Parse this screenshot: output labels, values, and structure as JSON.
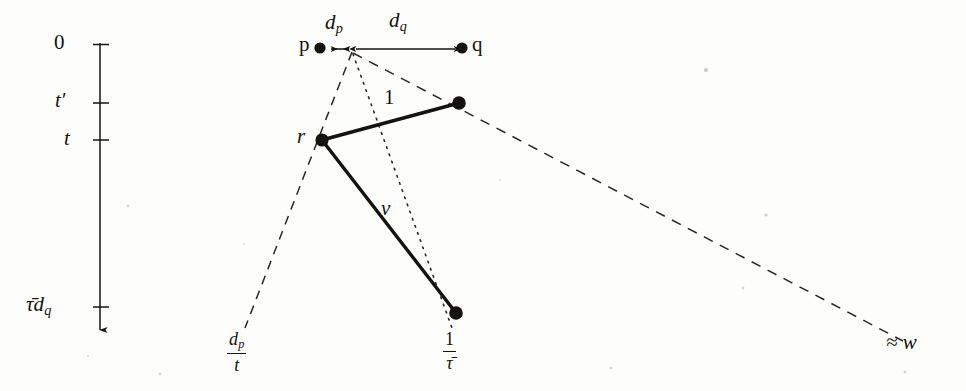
{
  "figure": {
    "background_color": "#fdfdfc",
    "ink_color": "#15130f",
    "width": 966,
    "height": 391
  },
  "axis": {
    "name": "vertical-time-axis",
    "orientation": "vertical-downward",
    "x": 100,
    "top_y": 45,
    "bottom_y": 332,
    "ticks": [
      {
        "label": "0",
        "y": 45,
        "kind": "plain"
      },
      {
        "label": "t",
        "prime": "′",
        "y": 103,
        "kind": "italic-prime"
      },
      {
        "label": "t",
        "y": 140,
        "kind": "italic"
      },
      {
        "label": "τ̄d",
        "subscript": "q",
        "y": 307,
        "kind": "italic-sub"
      }
    ],
    "tick_labels_plain": [
      "0",
      "t′",
      "t",
      "τ̄d_q"
    ]
  },
  "points": [
    {
      "name": "point-p",
      "label": "p",
      "label_style": "upright",
      "x": 320,
      "y": 48,
      "label_x": 300,
      "label_y": 36
    },
    {
      "name": "point-q",
      "label": "q",
      "label_style": "upright",
      "x": 462,
      "y": 48,
      "label_x": 472,
      "label_y": 36
    },
    {
      "name": "point-apex",
      "label": "",
      "x": 352,
      "y": 50
    },
    {
      "name": "point-r",
      "label": "r",
      "label_style": "italic",
      "x": 322,
      "y": 140,
      "label_x": 297,
      "label_y": 128
    },
    {
      "name": "point-upper-right",
      "label": "",
      "x": 459,
      "y": 103
    },
    {
      "name": "point-lower-right",
      "label": "",
      "x": 456,
      "y": 313
    }
  ],
  "measure_arrows": [
    {
      "name": "dp-measure-arrow",
      "label": "d",
      "subscript": "p",
      "label_plain": "d_p",
      "from_x": 322,
      "to_x": 352,
      "y": 49,
      "label_x": 328,
      "label_y": 22
    },
    {
      "name": "dq-measure-arrow",
      "label": "d",
      "subscript": "q",
      "label_plain": "d_q",
      "from_x": 352,
      "to_x": 461,
      "y": 49,
      "label_x": 392,
      "label_y": 20
    }
  ],
  "segments": [
    {
      "name": "segment-one",
      "label": "1",
      "label_style": "upright",
      "style": "solid-thick",
      "from": [
        322,
        140
      ],
      "to": [
        459,
        103
      ],
      "label_x": 384,
      "label_y": 88
    },
    {
      "name": "segment-v",
      "label": "v",
      "label_style": "italic",
      "style": "solid-thick",
      "from": [
        322,
        140
      ],
      "to": [
        456,
        313
      ],
      "label_x": 382,
      "label_y": 200
    }
  ],
  "rays": [
    {
      "name": "ray-dp-over-t",
      "style": "dashed",
      "from": [
        352,
        50
      ],
      "to": [
        243,
        330
      ],
      "label": {
        "numerator": "d",
        "numerator_sub": "p",
        "denominator": "t",
        "plain": "d_p/t"
      },
      "label_x": 238,
      "label_y": 334
    },
    {
      "name": "ray-one-over-tau-bar",
      "style": "dotted",
      "from": [
        352,
        50
      ],
      "to": [
        452,
        330
      ],
      "label": {
        "numerator": "1",
        "denominator": "τ̄",
        "plain": "1/τ̄"
      },
      "label_x": 447,
      "label_y": 333
    },
    {
      "name": "ray-approx-w",
      "style": "dashed",
      "from": [
        352,
        52
      ],
      "to": [
        903,
        341
      ],
      "label": "≈ w",
      "label_plain": "≈ w",
      "label_x": 893,
      "label_y": 342
    }
  ],
  "labels_flat": [
    "0",
    "t′",
    "t",
    "τ̄d_q",
    "p",
    "q",
    "r",
    "d_p",
    "d_q",
    "1",
    "v",
    "d_p/t",
    "1/τ̄",
    "≈ w"
  ]
}
